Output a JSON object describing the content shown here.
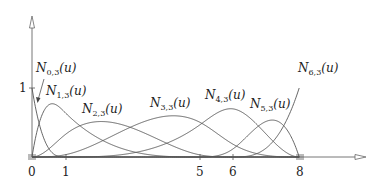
{
  "diagram": {
    "degree": 3,
    "knot_vector": [
      0,
      0,
      0,
      0,
      1,
      5,
      6,
      8,
      8,
      8,
      8
    ],
    "x_axis": {
      "ticks": [
        "0",
        "1",
        "5",
        "6",
        "8"
      ],
      "tick_values": [
        0,
        1,
        5,
        6,
        8
      ]
    },
    "y_axis": {
      "ticks": [
        "1"
      ],
      "tick_values": [
        1
      ]
    },
    "labels": [
      {
        "base": "N",
        "sub": "0,3",
        "arg": "(u)"
      },
      {
        "base": "N",
        "sub": "1,3",
        "arg": "(u)"
      },
      {
        "base": "N",
        "sub": "2,3",
        "arg": "(u)"
      },
      {
        "base": "N",
        "sub": "3,3",
        "arg": "(u)"
      },
      {
        "base": "N",
        "sub": "4,3",
        "arg": "(u)"
      },
      {
        "base": "N",
        "sub": "5,3",
        "arg": "(u)"
      },
      {
        "base": "N",
        "sub": "6,3",
        "arg": "(u)"
      }
    ],
    "colors": {
      "curve": "#555555",
      "axis": "#666666",
      "text": "#222222"
    }
  }
}
